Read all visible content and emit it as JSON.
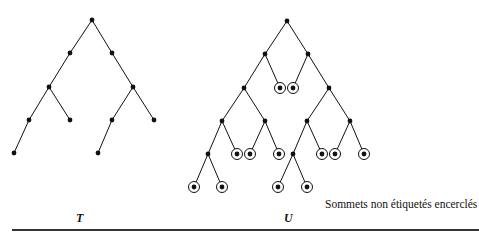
{
  "colors": {
    "ink": "#111111",
    "rule": "#333333",
    "background": "#ffffff"
  },
  "labels": {
    "tree_t": "T",
    "tree_u": "U",
    "legend": "Sommets non étiquetés encerclés"
  },
  "trees": [
    {
      "name": "T",
      "nodes": [
        {
          "id": "r",
          "x": 92,
          "y": 20
        },
        {
          "id": "a",
          "x": 70,
          "y": 53
        },
        {
          "id": "b",
          "x": 112,
          "y": 53
        },
        {
          "id": "c",
          "x": 49,
          "y": 87
        },
        {
          "id": "d",
          "x": 133,
          "y": 87
        },
        {
          "id": "e",
          "x": 29,
          "y": 120
        },
        {
          "id": "f",
          "x": 70,
          "y": 120
        },
        {
          "id": "g",
          "x": 112,
          "y": 120
        },
        {
          "id": "h",
          "x": 154,
          "y": 120
        },
        {
          "id": "i",
          "x": 14,
          "y": 153
        },
        {
          "id": "j",
          "x": 98,
          "y": 153
        }
      ],
      "edges": [
        [
          "r",
          "a"
        ],
        [
          "r",
          "b"
        ],
        [
          "a",
          "c"
        ],
        [
          "b",
          "d"
        ],
        [
          "c",
          "e"
        ],
        [
          "c",
          "f"
        ],
        [
          "d",
          "g"
        ],
        [
          "d",
          "h"
        ],
        [
          "e",
          "i"
        ],
        [
          "g",
          "j"
        ]
      ]
    },
    {
      "name": "U",
      "nodes": [
        {
          "id": "r",
          "x": 287,
          "y": 21
        },
        {
          "id": "a",
          "x": 265,
          "y": 54
        },
        {
          "id": "b",
          "x": 308,
          "y": 54
        },
        {
          "id": "c",
          "x": 244,
          "y": 88
        },
        {
          "id": "c2",
          "x": 280,
          "y": 88,
          "circled": true
        },
        {
          "id": "d2",
          "x": 293,
          "y": 88,
          "circled": true
        },
        {
          "id": "d",
          "x": 329,
          "y": 88
        },
        {
          "id": "e",
          "x": 222,
          "y": 121
        },
        {
          "id": "f",
          "x": 265,
          "y": 121
        },
        {
          "id": "g",
          "x": 307,
          "y": 121
        },
        {
          "id": "h",
          "x": 350,
          "y": 121
        },
        {
          "id": "i",
          "x": 208,
          "y": 154
        },
        {
          "id": "i2",
          "x": 237,
          "y": 154,
          "circled": true
        },
        {
          "id": "f1",
          "x": 250,
          "y": 154,
          "circled": true
        },
        {
          "id": "f2",
          "x": 279,
          "y": 154,
          "circled": true
        },
        {
          "id": "j",
          "x": 293,
          "y": 154
        },
        {
          "id": "g2",
          "x": 322,
          "y": 154,
          "circled": true
        },
        {
          "id": "h1",
          "x": 335,
          "y": 154,
          "circled": true
        },
        {
          "id": "h2",
          "x": 364,
          "y": 154,
          "circled": true
        },
        {
          "id": "i3",
          "x": 194,
          "y": 187,
          "circled": true
        },
        {
          "id": "i4",
          "x": 222,
          "y": 187,
          "circled": true
        },
        {
          "id": "j1",
          "x": 278,
          "y": 187,
          "circled": true
        },
        {
          "id": "j2",
          "x": 307,
          "y": 187,
          "circled": true
        }
      ],
      "edges": [
        [
          "r",
          "a"
        ],
        [
          "r",
          "b"
        ],
        [
          "a",
          "c"
        ],
        [
          "a",
          "c2"
        ],
        [
          "b",
          "d2"
        ],
        [
          "b",
          "d"
        ],
        [
          "c",
          "e"
        ],
        [
          "c",
          "f"
        ],
        [
          "d",
          "g"
        ],
        [
          "d",
          "h"
        ],
        [
          "e",
          "i"
        ],
        [
          "e",
          "i2"
        ],
        [
          "f",
          "f1"
        ],
        [
          "f",
          "f2"
        ],
        [
          "g",
          "j"
        ],
        [
          "g",
          "g2"
        ],
        [
          "h",
          "h1"
        ],
        [
          "h",
          "h2"
        ],
        [
          "i",
          "i3"
        ],
        [
          "i",
          "i4"
        ],
        [
          "j",
          "j1"
        ],
        [
          "j",
          "j2"
        ]
      ]
    }
  ]
}
